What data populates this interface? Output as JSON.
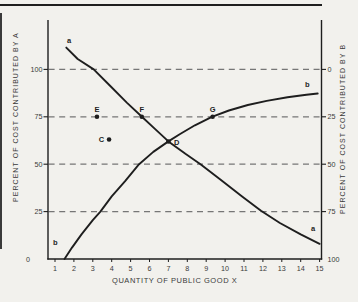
{
  "figure": {
    "left_axis_title": "PERCENT OF COST  CONTRIBUTED BY A",
    "right_axis_title": "PERCENT OF COST  CONTRIBUTED BY B",
    "x_axis_title": "QUANTITY OF PUBLIC GOOD X"
  },
  "colors": {
    "paper": "#f2f1ed",
    "ink": "#1e1e1e",
    "dash": "#767676",
    "text": "#3a3a3a"
  },
  "chart_data": {
    "type": "line",
    "title": "",
    "xlabel": "QUANTITY OF PUBLIC GOOD X",
    "left_ylabel": "PERCENT OF COST CONTRIBUTED BY A",
    "right_ylabel": "PERCENT OF COST CONTRIBUTED BY B",
    "x_ticks": [
      1,
      2,
      3,
      4,
      5,
      6,
      7,
      8,
      9,
      10,
      11,
      12,
      13,
      14,
      15
    ],
    "xlim": [
      1,
      15
    ],
    "left_axis_ticks": [
      {
        "label": "100",
        "pct": 100
      },
      {
        "label": "75",
        "pct": 75
      },
      {
        "label": "50",
        "pct": 50
      },
      {
        "label": "25",
        "pct": 25
      },
      {
        "label": "0",
        "pct": 0
      }
    ],
    "right_axis_ticks": [
      {
        "label": "0",
        "pct": 100
      },
      {
        "label": "25",
        "pct": 75
      },
      {
        "label": "50",
        "pct": 50
      },
      {
        "label": "75",
        "pct": 25
      },
      {
        "label": "100",
        "pct": 0
      }
    ],
    "gridlines_pct": [
      100,
      75,
      50,
      25
    ],
    "grid_style": "dashed",
    "series": [
      {
        "name": "a",
        "points": [
          [
            1.6,
            111.5
          ],
          [
            2.2,
            105.5
          ],
          [
            3.05,
            100
          ],
          [
            3.9,
            91.5
          ],
          [
            4.8,
            82.5
          ],
          [
            5.6,
            75
          ],
          [
            6.3,
            68.5
          ],
          [
            7.0,
            62
          ],
          [
            7.9,
            55.5
          ],
          [
            8.7,
            50
          ],
          [
            9.8,
            41.5
          ],
          [
            10.9,
            33
          ],
          [
            11.9,
            25.5
          ],
          [
            12.9,
            19
          ],
          [
            14.0,
            13
          ],
          [
            15.0,
            8
          ]
        ]
      },
      {
        "name": "b",
        "points": [
          [
            1.5,
            0
          ],
          [
            1.9,
            6
          ],
          [
            2.4,
            13
          ],
          [
            3.0,
            20.5
          ],
          [
            3.4,
            25
          ],
          [
            4.0,
            33
          ],
          [
            4.7,
            41
          ],
          [
            5.45,
            50
          ],
          [
            6.2,
            56.5
          ],
          [
            7.0,
            62
          ],
          [
            7.6,
            65.8
          ],
          [
            8.4,
            70.5
          ],
          [
            9.3,
            75
          ],
          [
            10.2,
            78.3
          ],
          [
            11.2,
            81.2
          ],
          [
            12.2,
            83.4
          ],
          [
            13.3,
            85.3
          ],
          [
            14.3,
            86.6
          ],
          [
            14.9,
            87.3
          ]
        ]
      }
    ],
    "curve_labels": [
      {
        "text": "a",
        "x": 1.75,
        "y": 114
      },
      {
        "text": "a",
        "x": 14.65,
        "y": 15
      },
      {
        "text": "b",
        "x": 1.02,
        "y": 7.5
      },
      {
        "text": "b",
        "x": 14.35,
        "y": 90.5
      }
    ],
    "labeled_points": [
      {
        "label": "C",
        "x": 3.86,
        "y": 63,
        "label_side": "left"
      },
      {
        "label": "D",
        "x": 7.0,
        "y": 62,
        "label_side": "right"
      },
      {
        "label": "E",
        "x": 3.22,
        "y": 75,
        "label_side": "above"
      },
      {
        "label": "F",
        "x": 5.59,
        "y": 75,
        "label_side": "above"
      },
      {
        "label": "G",
        "x": 9.34,
        "y": 75,
        "label_side": "above"
      }
    ],
    "legend_position": "none"
  }
}
